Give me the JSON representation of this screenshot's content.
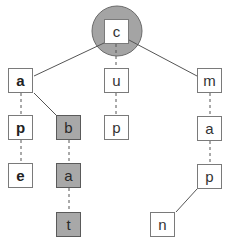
{
  "diagram": {
    "type": "trie",
    "colors": {
      "background": "#ffffff",
      "node_border": "#7a7a7a",
      "node_fill": "#ffffff",
      "highlight_fill": "#a8a8a8",
      "highlight_border": "#5a5a5a",
      "root_circle_fill": "#a4a4a4",
      "edge": "#555555"
    },
    "root": {
      "label": "c",
      "x": 104,
      "y": 19,
      "circle": {
        "cx": 117,
        "cy": 31,
        "r": 25
      }
    },
    "nodes": [
      {
        "id": "n_a1",
        "label": "a",
        "x": 8,
        "y": 68,
        "highlight": false,
        "bold": true
      },
      {
        "id": "n_p1",
        "label": "p",
        "x": 8,
        "y": 115,
        "highlight": false,
        "bold": true
      },
      {
        "id": "n_e1",
        "label": "e",
        "x": 8,
        "y": 163,
        "highlight": false,
        "bold": true
      },
      {
        "id": "n_b",
        "label": "b",
        "x": 56,
        "y": 115,
        "highlight": true,
        "bold": false
      },
      {
        "id": "n_a2",
        "label": "a",
        "x": 56,
        "y": 163,
        "highlight": true,
        "bold": false
      },
      {
        "id": "n_t",
        "label": "t",
        "x": 56,
        "y": 212,
        "highlight": true,
        "bold": false
      },
      {
        "id": "n_u",
        "label": "u",
        "x": 104,
        "y": 68,
        "highlight": false,
        "bold": false
      },
      {
        "id": "n_p2",
        "label": "p",
        "x": 104,
        "y": 115,
        "highlight": false,
        "bold": false
      },
      {
        "id": "n_m",
        "label": "m",
        "x": 197,
        "y": 68,
        "highlight": false,
        "bold": false
      },
      {
        "id": "n_a3",
        "label": "a",
        "x": 197,
        "y": 116,
        "highlight": false,
        "bold": false
      },
      {
        "id": "n_p3",
        "label": "p",
        "x": 197,
        "y": 164,
        "highlight": false,
        "bold": false
      },
      {
        "id": "n_n",
        "label": "n",
        "x": 150,
        "y": 212,
        "highlight": false,
        "bold": false
      }
    ],
    "edges": [
      {
        "from": "root",
        "to": "n_a1",
        "style": "solid"
      },
      {
        "from": "root",
        "to": "n_u",
        "style": "dashed"
      },
      {
        "from": "root",
        "to": "n_m",
        "style": "solid"
      },
      {
        "from": "n_a1",
        "to": "n_p1",
        "style": "dashed"
      },
      {
        "from": "n_p1",
        "to": "n_e1",
        "style": "dashed"
      },
      {
        "from": "n_a1",
        "to": "n_b",
        "style": "solid"
      },
      {
        "from": "n_b",
        "to": "n_a2",
        "style": "dashed"
      },
      {
        "from": "n_a2",
        "to": "n_t",
        "style": "dashed"
      },
      {
        "from": "n_u",
        "to": "n_p2",
        "style": "dashed"
      },
      {
        "from": "n_m",
        "to": "n_a3",
        "style": "dashed"
      },
      {
        "from": "n_a3",
        "to": "n_p3",
        "style": "dashed"
      },
      {
        "from": "n_p3",
        "to": "n_n",
        "style": "solid"
      }
    ]
  }
}
